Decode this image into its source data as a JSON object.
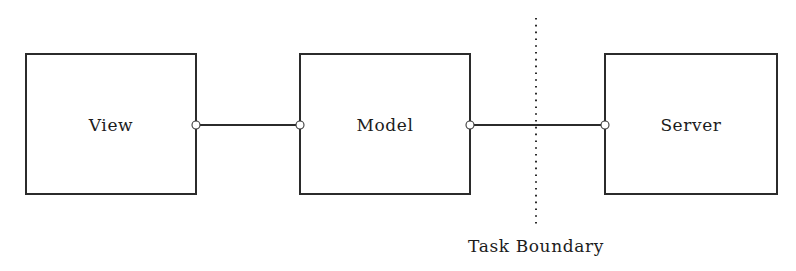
{
  "diagram": {
    "canvas": {
      "width": 796,
      "height": 271,
      "background": "#ffffff"
    },
    "stroke_color": "#2b2b2b",
    "text_color": "#1c1c1c",
    "nodes": [
      {
        "id": "view",
        "label": "View",
        "x": 26,
        "y": 54,
        "width": 170,
        "height": 140,
        "center_x": 111,
        "center_y": 125
      },
      {
        "id": "model",
        "label": "Model",
        "x": 300,
        "y": 54,
        "width": 170,
        "height": 140,
        "center_x": 385,
        "center_y": 125
      },
      {
        "id": "server",
        "label": "Server",
        "x": 605,
        "y": 54,
        "width": 172,
        "height": 140,
        "center_x": 691,
        "center_y": 125
      }
    ],
    "connections": [
      {
        "id": "view-model",
        "from": "view",
        "to": "model",
        "x1": 196,
        "x2": 300,
        "y": 125
      },
      {
        "id": "model-server",
        "from": "model",
        "to": "server",
        "x1": 470,
        "x2": 605,
        "y": 125
      }
    ],
    "ports": [
      {
        "id": "view-right",
        "cx": 196,
        "cy": 125,
        "r": 4
      },
      {
        "id": "model-left",
        "cx": 300,
        "cy": 125,
        "r": 4
      },
      {
        "id": "model-right",
        "cx": 470,
        "cy": 125,
        "r": 4
      },
      {
        "id": "server-left",
        "cx": 605,
        "cy": 125,
        "r": 4
      }
    ],
    "boundary": {
      "label": "Task Boundary",
      "x": 536,
      "y_top": 18,
      "y_bottom": 228,
      "label_x": 536,
      "label_y": 252
    }
  }
}
